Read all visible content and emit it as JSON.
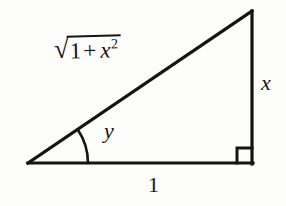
{
  "figure": {
    "background_color": "#fdfdfc",
    "stroke_color": "#141414",
    "stroke_width": 3,
    "labels": {
      "hypotenuse_radical_sign": "√",
      "hypotenuse_radicand_one": "1",
      "hypotenuse_radicand_plus": "+",
      "hypotenuse_radicand_var": "x",
      "hypotenuse_radicand_exponent": "2",
      "hypotenuse_full_text": "√(1 + x²)",
      "vertical_side": "x",
      "base_side": "1",
      "angle": "y"
    },
    "geometry": {
      "left_vertex": [
        28,
        163
      ],
      "right_angle_vertex": [
        252,
        163
      ],
      "apex_vertex": [
        252,
        11
      ],
      "right_angle_marker_size": 15,
      "angle_arc_radius": 60,
      "angle_degrees": 34
    }
  }
}
